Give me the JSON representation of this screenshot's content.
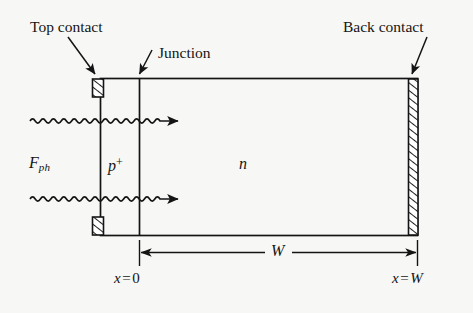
{
  "figure": {
    "type": "semiconductor-device-cross-section",
    "background_color": "#f7f7f5",
    "ink_color": "#141414"
  },
  "annotations": {
    "top_contact": "Top contact",
    "junction": "Junction",
    "back_contact": "Back contact"
  },
  "regions": {
    "emitter_label": "p",
    "emitter_superscript": "+",
    "base_label": "n"
  },
  "illumination": {
    "flux_symbol": "F",
    "flux_subscript": "ph",
    "ray_count": 2
  },
  "dimensions": {
    "width_symbol": "W",
    "left_boundary": {
      "variable": "x",
      "operator": "=",
      "value": "0"
    },
    "right_boundary": {
      "variable": "x",
      "operator": "=",
      "value": "W"
    }
  }
}
